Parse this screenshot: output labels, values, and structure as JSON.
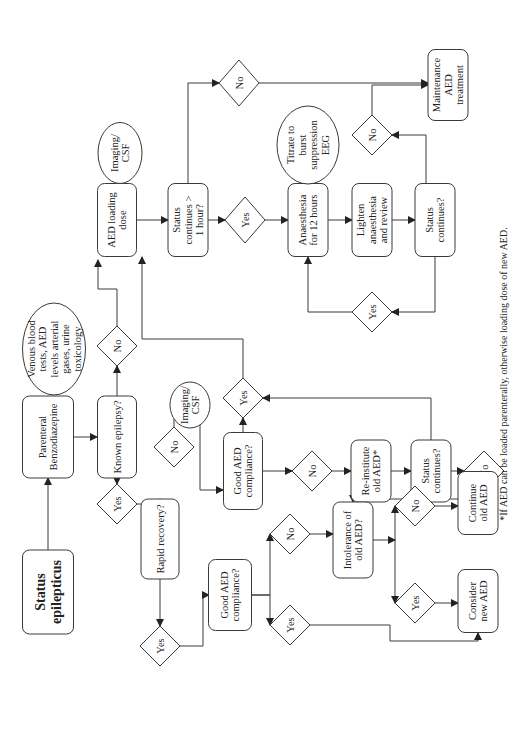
{
  "diagram": {
    "footnote": "*If AED can be loaded parenterally, otherwise loading dose of new AED.",
    "nodes": {
      "status_epilepticus": {
        "type": "box",
        "lines": [
          "Status",
          "epilepticus"
        ],
        "bold": true
      },
      "parenteral_benzo": {
        "type": "box",
        "lines": [
          "Parenteral",
          "Benzodiazepine"
        ]
      },
      "venous_tests": {
        "type": "ellipse",
        "lines": [
          "Venous blood",
          "tests, AED",
          "levels arterial",
          "gases, urine",
          "toxicology"
        ]
      },
      "known_epilepsy": {
        "type": "box",
        "lines": [
          "Known epilepsy?"
        ]
      },
      "known_no": {
        "type": "diamond",
        "lines": [
          "No"
        ]
      },
      "known_yes": {
        "type": "diamond",
        "lines": [
          "Yes"
        ]
      },
      "aed_loading": {
        "type": "box",
        "lines": [
          "AED loading",
          "dose"
        ]
      },
      "imaging_csf_top": {
        "type": "ellipse",
        "lines": [
          "Imaging/",
          "CSF"
        ]
      },
      "status_gt_1h": {
        "type": "box",
        "lines": [
          "Status",
          "continues >",
          "1 hour?"
        ]
      },
      "gt1h_no": {
        "type": "diamond",
        "lines": [
          "No"
        ]
      },
      "gt1h_yes": {
        "type": "diamond",
        "lines": [
          "Yes"
        ]
      },
      "anaesthesia": {
        "type": "box",
        "lines": [
          "Anaesthesia",
          "for 12 hours"
        ]
      },
      "titrate_eeg": {
        "type": "ellipse",
        "lines": [
          "Titrate to",
          "burst",
          "suppression",
          "EEG"
        ]
      },
      "lighten": {
        "type": "box",
        "lines": [
          "Lighten",
          "anaesthesia",
          "and review"
        ]
      },
      "status_continues_right": {
        "type": "box",
        "lines": [
          "Status",
          "continues?"
        ]
      },
      "right_no": {
        "type": "diamond",
        "lines": [
          "No"
        ]
      },
      "loop_yes": {
        "type": "diamond",
        "lines": [
          "Yes"
        ]
      },
      "maintenance": {
        "type": "box",
        "lines": [
          "Maintenance",
          "AED",
          "treatment"
        ]
      },
      "rapid_recovery": {
        "type": "box",
        "lines": [
          "Rapid recovery?"
        ]
      },
      "rapid_no": {
        "type": "diamond",
        "lines": [
          "No"
        ]
      },
      "imaging_csf_mid": {
        "type": "ellipse",
        "lines": [
          "Imaging/",
          "CSF"
        ]
      },
      "good_compliance_mid": {
        "type": "box",
        "lines": [
          "Good AED",
          "compliance?"
        ]
      },
      "mid_yes": {
        "type": "diamond",
        "lines": [
          "Yes"
        ]
      },
      "mid_no": {
        "type": "diamond",
        "lines": [
          "No"
        ]
      },
      "reinstitute": {
        "type": "box",
        "lines": [
          "Re-institute",
          "old AED*"
        ]
      },
      "status_continues_mid": {
        "type": "box",
        "lines": [
          "Status",
          "continues?"
        ]
      },
      "mid_status_no": {
        "type": "diamond",
        "lines": [
          "No"
        ]
      },
      "rapid_yes": {
        "type": "diamond",
        "lines": [
          "Yes"
        ]
      },
      "good_compliance_low": {
        "type": "box",
        "lines": [
          "Good AED",
          "compliance?"
        ]
      },
      "low_no": {
        "type": "diamond",
        "lines": [
          "No"
        ]
      },
      "low_yes": {
        "type": "diamond",
        "lines": [
          "Yes"
        ]
      },
      "intolerance": {
        "type": "box",
        "lines": [
          "Intolerance of",
          "old AED?"
        ]
      },
      "intol_no": {
        "type": "diamond",
        "lines": [
          "No"
        ]
      },
      "intol_yes": {
        "type": "diamond",
        "lines": [
          "Yes"
        ]
      },
      "continue_old": {
        "type": "box",
        "lines": [
          "Continue",
          "old AED"
        ]
      },
      "consider_new": {
        "type": "box",
        "lines": [
          "Consider",
          "new AED"
        ]
      }
    }
  }
}
